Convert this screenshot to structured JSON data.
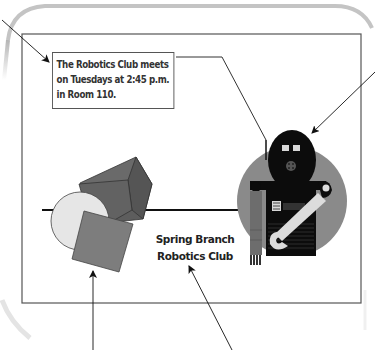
{
  "poster": {
    "info_box": {
      "lines": [
        "The Robotics Club meets",
        "on Tuesdays at 2:45 p.m.",
        "in Room 110."
      ]
    },
    "club_name": {
      "lines": [
        "Spring Branch",
        "Robotics Club"
      ]
    },
    "graphics": {
      "shapes": [
        "cube",
        "circle",
        "square"
      ],
      "robot": [
        "head",
        "body",
        "arm",
        "wrench"
      ]
    },
    "callout_arrows": [
      "arrow-to-info-box",
      "arrow-to-robot-head",
      "arrow-to-shapes",
      "arrow-to-club-name"
    ]
  },
  "colors": {
    "frame": "#bdbdbd",
    "border": "#555555",
    "cube_dark": "#5e5e5e",
    "cube_mid": "#6e6e6e",
    "square": "#7c7c7c",
    "circle": "#e6e6e6",
    "robot_circle": "#8a8a8a",
    "robot_black": "#0e0e0e",
    "wrench": "#dddddd"
  }
}
